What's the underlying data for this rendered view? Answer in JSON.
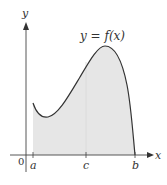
{
  "figure": {
    "function_label": "y = f(x)",
    "y_axis_label": "y",
    "x_axis_label": "x",
    "origin_label": "0",
    "points": [
      {
        "label": "a",
        "x": 33
      },
      {
        "label": "c",
        "x": 86
      },
      {
        "label": "b",
        "x": 135
      }
    ],
    "colors": {
      "curve": "#333333",
      "fill": "#e6e6e6",
      "axis": "#444444"
    }
  }
}
